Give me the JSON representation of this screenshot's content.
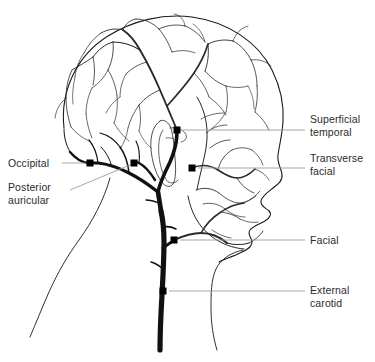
{
  "figure": {
    "type": "anatomical-line-diagram",
    "background_color": "#ffffff",
    "outline_color": "#1a1a1a",
    "vessel_color": "#111111",
    "leader_line_color": "#9a9a9a",
    "marker_color": "#000000",
    "text_color": "#2b2b2b"
  },
  "labels": {
    "superficial_temporal": {
      "text": "Superficial\ntemporal",
      "side": "right",
      "text_x": 310,
      "text_y": 113,
      "marker_x": 177,
      "marker_y": 130,
      "leader_from_x": 183,
      "leader_to_x": 305,
      "leader_y": 130
    },
    "transverse_facial": {
      "text": "Transverse\nfacial",
      "side": "right",
      "text_x": 310,
      "text_y": 152,
      "marker_x": 192,
      "marker_y": 168,
      "leader_from_x": 198,
      "leader_to_x": 305,
      "leader_y": 168
    },
    "facial": {
      "text": "Facial",
      "side": "right",
      "text_x": 310,
      "text_y": 234,
      "marker_x": 174,
      "marker_y": 240,
      "leader_from_x": 180,
      "leader_to_x": 305,
      "leader_y": 240
    },
    "external_carotid": {
      "text": "External\ncarotid",
      "side": "right",
      "text_x": 310,
      "text_y": 284,
      "marker_x": 163,
      "marker_y": 291,
      "leader_from_x": 169,
      "leader_to_x": 305,
      "leader_y": 291
    },
    "occipital": {
      "text": "Occipital",
      "side": "left",
      "text_x": 8,
      "text_y": 157,
      "marker_x": 90,
      "marker_y": 163,
      "leader_from_x": 62,
      "leader_to_x": 86,
      "leader_y": 163
    },
    "posterior_auricular": {
      "text": "Posterior\nauricular",
      "side": "left",
      "text_x": 8,
      "text_y": 181,
      "marker_x": 134,
      "marker_y": 163,
      "leader_from_x": 70,
      "leader_from_y": 190,
      "leader_to_x": 130,
      "leader_to_y": 165
    }
  },
  "arteries": [
    "external carotid",
    "occipital",
    "posterior auricular",
    "superficial temporal",
    "transverse facial",
    "facial"
  ]
}
